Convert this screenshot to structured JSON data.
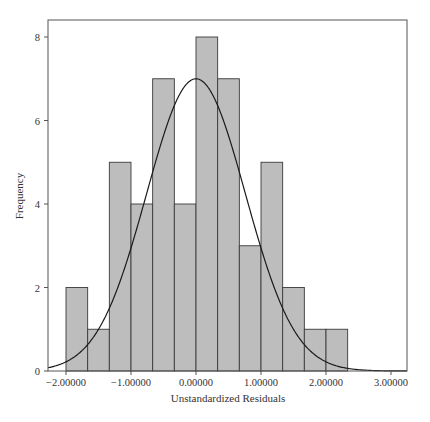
{
  "chart_data": {
    "type": "bar",
    "subtype": "histogram-with-normal-curve",
    "title": "",
    "xlabel": "Unstandardized Residuals",
    "ylabel": "Frequency",
    "bin_width": 0.33333,
    "bin_edges": [
      -2.0,
      -1.66667,
      -1.33333,
      -1.0,
      -0.66667,
      -0.33333,
      0.0,
      0.33333,
      0.66667,
      1.0,
      1.33333,
      1.66667,
      2.0,
      2.33333
    ],
    "values": [
      2,
      1,
      5,
      4,
      7,
      4,
      8,
      7,
      3,
      5,
      2,
      1,
      1
    ],
    "xlim": [
      -2.28,
      3.25
    ],
    "ylim": [
      0,
      8.7
    ],
    "x_ticks": [
      -2,
      -1,
      0,
      1,
      2,
      3
    ],
    "x_tick_labels": [
      "−2.00000",
      "−1.00000",
      "0.00000",
      "1.00000",
      "2.00000",
      "3.00000"
    ],
    "y_ticks": [
      0,
      2,
      4,
      6,
      8
    ],
    "y_tick_labels": [
      "0",
      "2",
      "4",
      "6",
      "8"
    ],
    "normal_curve": {
      "mean": 0.0,
      "peak": 7.0,
      "sd": 0.76
    },
    "grid": false,
    "legend": null,
    "colors": {
      "bar_fill": "#bdbdbd",
      "bar_edge": "#3a3a3a",
      "curve": "#1a1a1a",
      "frame": "#555555"
    }
  }
}
